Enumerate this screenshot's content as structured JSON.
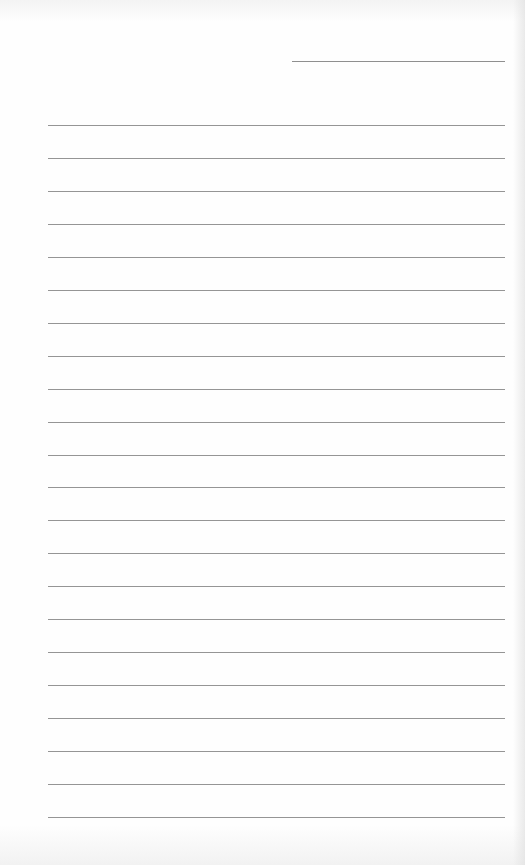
{
  "document": {
    "type": "lined-paper",
    "header_line": {
      "label": "",
      "value": ""
    },
    "rule_color": "#959595",
    "background_color": "#fefefe",
    "lines": [
      {
        "text": ""
      },
      {
        "text": ""
      },
      {
        "text": ""
      },
      {
        "text": ""
      },
      {
        "text": ""
      },
      {
        "text": ""
      },
      {
        "text": ""
      },
      {
        "text": ""
      },
      {
        "text": ""
      },
      {
        "text": ""
      },
      {
        "text": ""
      },
      {
        "text": ""
      },
      {
        "text": ""
      },
      {
        "text": ""
      },
      {
        "text": ""
      },
      {
        "text": ""
      },
      {
        "text": ""
      },
      {
        "text": ""
      },
      {
        "text": ""
      },
      {
        "text": ""
      },
      {
        "text": ""
      },
      {
        "text": ""
      }
    ]
  }
}
